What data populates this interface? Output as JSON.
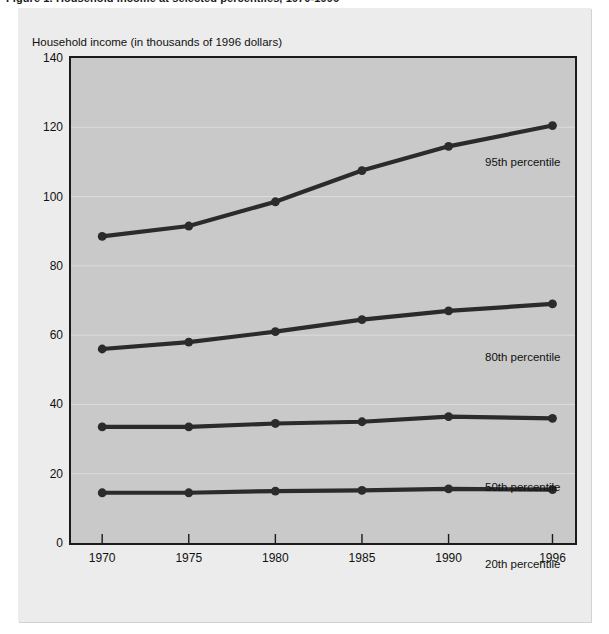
{
  "figure": {
    "caption": "Figure 1. Household income at selected percentiles, 1970-1996",
    "caption_visible_note": "top of figure caption cropped at image edge"
  },
  "chart_data": {
    "type": "line",
    "title": "",
    "xlabel": "",
    "ylabel": "Household income (in thousands of 1996 dollars)",
    "x": [
      1970,
      1975,
      1980,
      1985,
      1990,
      1996
    ],
    "xticklabels": [
      "1970",
      "1975",
      "1980",
      "1985",
      "1990",
      "1996"
    ],
    "yticklabels": [
      "0",
      "20",
      "40",
      "60",
      "80",
      "100",
      "120",
      "140"
    ],
    "yticks": [
      0,
      20,
      40,
      60,
      80,
      100,
      120,
      140
    ],
    "ylim": [
      0,
      140
    ],
    "xlim": [
      1968.2,
      1997.3
    ],
    "grid": true,
    "legend": "inline-annotations",
    "markers": "filled-circle",
    "series": [
      {
        "name": "95th percentile",
        "label": "95th percentile",
        "values": [
          88.5,
          91.5,
          98.5,
          107.5,
          114.5,
          120.5
        ],
        "color": "#2b2b2b"
      },
      {
        "name": "80th percentile",
        "label": "80th percentile",
        "values": [
          56.0,
          58.0,
          61.0,
          64.5,
          67.0,
          69.0
        ],
        "color": "#2b2b2b"
      },
      {
        "name": "50th percentile",
        "label": "50th percentile",
        "values": [
          33.5,
          33.5,
          34.5,
          35.0,
          36.5,
          36.0
        ],
        "color": "#2b2b2b"
      },
      {
        "name": "20th percentile",
        "label": "20th percentile",
        "values": [
          14.5,
          14.5,
          15.0,
          15.2,
          15.6,
          15.4
        ],
        "color": "#2b2b2b"
      }
    ],
    "colors": {
      "plot_background": "#c9c9c9",
      "panel_background": "#ececec",
      "axis": "#1b1b1b",
      "gridline": "#dcdcdc",
      "line": "#2b2b2b",
      "text": "#111111"
    }
  }
}
